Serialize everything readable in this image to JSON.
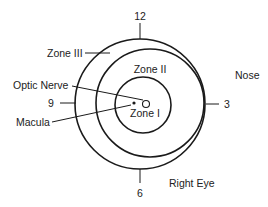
{
  "diagram": {
    "clock": {
      "twelve": "12",
      "three": "3",
      "six": "6",
      "nine": "9"
    },
    "zones": {
      "zone1": "Zone I",
      "zone2": "Zone II",
      "zone3": "Zone III"
    },
    "landmarks": {
      "optic_nerve": "Optic Nerve",
      "macula": "Macula"
    },
    "orientation": {
      "nose": "Nose",
      "eye": "Right Eye"
    },
    "colors": {
      "line": "#1a1a1a",
      "text": "#222222",
      "background": "#ffffff"
    }
  }
}
